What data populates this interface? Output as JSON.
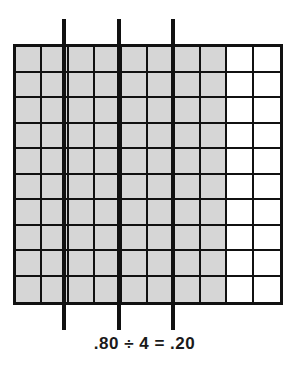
{
  "figure": {
    "kind": "decimal-hundredths-grid",
    "caption": ".80 ÷ 4 = .20"
  },
  "chart_data": {
    "type": "heatmap",
    "title": ".80 ÷ 4 = .20",
    "xlabel": "",
    "ylabel": "",
    "rows": 10,
    "cols": 10,
    "total_cells": 100,
    "shaded_cells": 80,
    "unshaded_cells": 20,
    "shaded_fraction": "0.80",
    "quotient": "0.20",
    "divisor": "4",
    "cells_per_group": 20,
    "columns_per_group": 2,
    "shaded_columns": [
      1,
      2,
      3,
      4,
      5,
      6,
      7,
      8
    ],
    "unshaded_columns": [
      9,
      10
    ],
    "grid": [
      [
        1,
        1,
        1,
        1,
        1,
        1,
        1,
        1,
        0,
        0
      ],
      [
        1,
        1,
        1,
        1,
        1,
        1,
        1,
        1,
        0,
        0
      ],
      [
        1,
        1,
        1,
        1,
        1,
        1,
        1,
        1,
        0,
        0
      ],
      [
        1,
        1,
        1,
        1,
        1,
        1,
        1,
        1,
        0,
        0
      ],
      [
        1,
        1,
        1,
        1,
        1,
        1,
        1,
        1,
        0,
        0
      ],
      [
        1,
        1,
        1,
        1,
        1,
        1,
        1,
        1,
        0,
        0
      ],
      [
        1,
        1,
        1,
        1,
        1,
        1,
        1,
        1,
        0,
        0
      ],
      [
        1,
        1,
        1,
        1,
        1,
        1,
        1,
        1,
        0,
        0
      ],
      [
        1,
        1,
        1,
        1,
        1,
        1,
        1,
        1,
        0,
        0
      ],
      [
        1,
        1,
        1,
        1,
        1,
        1,
        1,
        1,
        0,
        0
      ]
    ],
    "group_dividers_after_columns": [
      2,
      4,
      6
    ],
    "colors": {
      "shaded": "#d6d6d6",
      "unshaded": "#ffffff",
      "grid_line": "#111111",
      "divider": "#111111",
      "background": "#ffffff",
      "caption_text": "#1a1a1a"
    },
    "legend": [
      {
        "label": "shaded (part of .80)",
        "color": "#d6d6d6"
      },
      {
        "label": "unshaded",
        "color": "#ffffff"
      }
    ],
    "annotations": [
      {
        "text": ".80 ÷ 4 = .20",
        "position": "below-grid"
      }
    ]
  }
}
